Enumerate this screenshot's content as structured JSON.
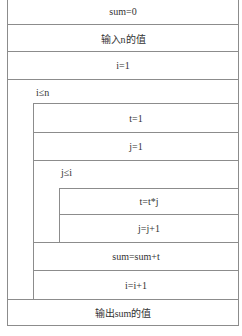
{
  "diagram": {
    "type": "N-S flowchart",
    "steps": {
      "init_sum": "sum=0",
      "input_n": "输入n的值",
      "init_i": "i=1",
      "outer_condition": "i≤n",
      "init_t": "t=1",
      "init_j": "j=1",
      "inner_condition": "j≤i",
      "update_t": "t=t*j",
      "update_j": "j=j+1",
      "update_sum": "sum=sum+t",
      "update_i": "i=i+1",
      "output_sum": "输出sum的值"
    },
    "colors": {
      "line": "#8c8c8c",
      "text": "#333333",
      "background": "#ffffff"
    }
  }
}
